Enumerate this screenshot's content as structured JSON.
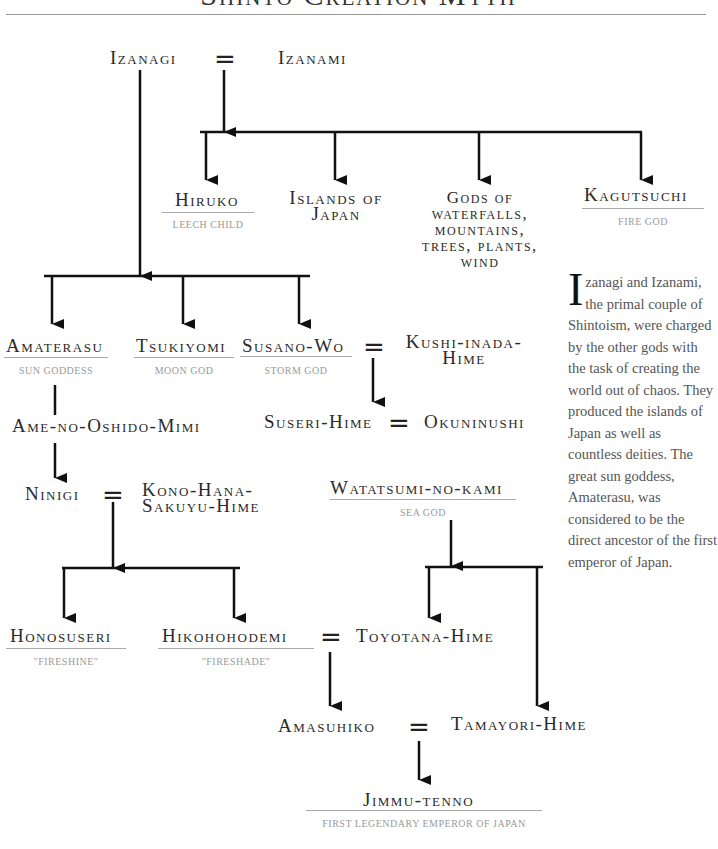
{
  "title": "Shinto Creation Myth",
  "people": {
    "izanagi": {
      "name": "Izanagi"
    },
    "izanami": {
      "name": "Izanami"
    },
    "hiruko": {
      "name": "Hiruko",
      "subtitle": "Leech child"
    },
    "islands": {
      "name": "Islands of Japan"
    },
    "gods_of": {
      "name": "Gods of waterfalls, mountains, trees, plants, wind"
    },
    "kagutsuchi": {
      "name": "Kagutsuchi",
      "subtitle": "Fire god"
    },
    "amaterasu": {
      "name": "Amaterasu",
      "subtitle": "Sun goddess"
    },
    "tsukiyomi": {
      "name": "Tsukiyomi",
      "subtitle": "Moon god"
    },
    "susano_wo": {
      "name": "Susano-Wo",
      "subtitle": "Storm god"
    },
    "kushi_inada_hime": {
      "name": "Kushi-inada-Hime"
    },
    "ame_no_oshido_mimi": {
      "name": "Ame-no-Oshido-Mimi"
    },
    "suseri_hime": {
      "name": "Suseri-Hime"
    },
    "okuninushi": {
      "name": "Okuninushi"
    },
    "ninigi": {
      "name": "Ninigi"
    },
    "kono_hana_sakuyu_hime": {
      "name": "Kono-Hana-Sakuyu-Hime"
    },
    "watatsumi_no_kami": {
      "name": "Watatsumi-no-kami",
      "subtitle": "Sea god"
    },
    "honosuseri": {
      "name": "Honosuseri",
      "subtitle": "\"Fireshine\""
    },
    "hikohohodemi": {
      "name": "Hikohohodemi",
      "subtitle": "\"Fireshade\""
    },
    "toyotana_hime": {
      "name": "Toyotana-Hime"
    },
    "amasuhiko": {
      "name": "Amasuhiko"
    },
    "tamayori_hime": {
      "name": "Tamayori-Hime"
    },
    "jimmu_tenno": {
      "name": "Jimmu-tenno",
      "subtitle": "First legendary emperor of Japan"
    }
  },
  "marriage_symbol": "=",
  "sidebar": {
    "dropcap": "I",
    "text": "zanagi and Izanami, the primal couple of Shintoism, were charged by the other gods with the task of creating the world out of chaos. They produced the islands of Japan as well as countless deities. The great sun goddess, Amaterasu, was considered to be the direct ancestor of the first emperor of Japan."
  }
}
